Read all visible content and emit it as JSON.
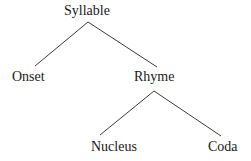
{
  "diagram": {
    "type": "syllable-structure-tree",
    "nodes": {
      "root": "Syllable",
      "onset": "Onset",
      "rhyme": "Rhyme",
      "nucleus": "Nucleus",
      "coda": "Coda"
    },
    "edges": [
      [
        "Syllable",
        "Onset"
      ],
      [
        "Syllable",
        "Rhyme"
      ],
      [
        "Rhyme",
        "Nucleus"
      ],
      [
        "Rhyme",
        "Coda"
      ]
    ],
    "colors": {
      "line": "#3a3a3a",
      "text": "#1a1a1a",
      "background": "#ffffff"
    }
  }
}
